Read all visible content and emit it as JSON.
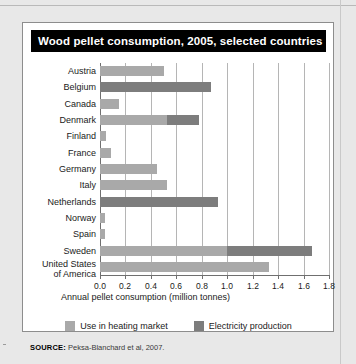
{
  "figure": {
    "title": "Wood pellet consumption, 2005, selected countries",
    "source_label": "SOURCE:",
    "source_text": "Peksa-Blanchard et al, 2007."
  },
  "legend": {
    "position": "bottom-center",
    "items": [
      {
        "label": "Use in heating market",
        "color": "#a9a9a9",
        "key": "heating"
      },
      {
        "label": "Electricity production",
        "color": "#7d7d7d",
        "key": "electricity"
      }
    ]
  },
  "chart_data": {
    "type": "bar",
    "orientation": "horizontal",
    "stacked": true,
    "title": "Wood pellet consumption, 2005, selected countries",
    "xlabel": "Annual pellet consumption (million tonnes)",
    "ylabel": "",
    "xlim": [
      0.0,
      1.8
    ],
    "xticks": [
      0.0,
      0.2,
      0.4,
      0.6,
      0.8,
      1.0,
      1.2,
      1.4,
      1.6,
      1.8
    ],
    "xtick_labels": [
      "0.0",
      "0.2",
      "0.4",
      "0.6",
      "0.8",
      "1.0",
      "1.2",
      "1.4",
      "1.6",
      "1.8"
    ],
    "grid": "vertical",
    "categories": [
      "Austria",
      "Belgium",
      "Canada",
      "Denmark",
      "Finland",
      "France",
      "Germany",
      "Italy",
      "Netherlands",
      "Norway",
      "Spain",
      "Sweden",
      "United States\nof America"
    ],
    "series": [
      {
        "name": "Use in heating market",
        "color": "#a9a9a9",
        "values": [
          0.5,
          0.0,
          0.15,
          0.53,
          0.05,
          0.09,
          0.45,
          0.53,
          0.0,
          0.04,
          0.04,
          1.0,
          1.33
        ]
      },
      {
        "name": "Electricity production",
        "color": "#7d7d7d",
        "values": [
          0.0,
          0.87,
          0.0,
          0.25,
          0.0,
          0.0,
          0.0,
          0.0,
          0.93,
          0.0,
          0.0,
          0.67,
          0.0
        ]
      }
    ],
    "totals": [
      0.5,
      0.87,
      0.15,
      0.78,
      0.05,
      0.09,
      0.45,
      0.53,
      0.93,
      0.04,
      0.04,
      1.67,
      1.33
    ]
  }
}
